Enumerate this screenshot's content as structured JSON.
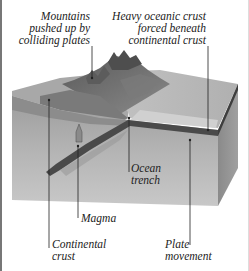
{
  "diagram": {
    "title_fragment": "(plate collision diagram, top caption cut off)",
    "labels": {
      "mountains": [
        "Mountains",
        "pushed up by",
        "colliding plates"
      ],
      "heavy_crust": [
        "Heavy oceanic crust",
        "forced beneath",
        "continental crust"
      ],
      "ocean_trench": [
        "Ocean",
        "trench"
      ],
      "magma": [
        "Magma"
      ],
      "continental_crust": [
        "Continental",
        "crust"
      ],
      "plate_movement": [
        "Plate",
        "movement"
      ]
    },
    "colors": {
      "border": "#777777",
      "block_top": "#b8b8b8",
      "block_front": "#a9a9a9",
      "block_side": "#8c8c8c",
      "mountain": "#6e6e6e",
      "ocean_plate": "#4a4a4a",
      "leader_line": "#222222",
      "text": "#222222"
    }
  }
}
